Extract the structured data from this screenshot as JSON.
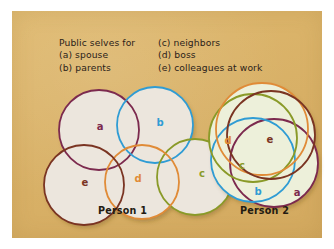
{
  "figure": {
    "background_color": "#ffffff",
    "panel_color": "#d9b267"
  },
  "legend": {
    "left_column": [
      "Public selves for",
      "(a) spouse",
      "(b) parents"
    ],
    "right_column": [
      "(c) neighbors",
      "(d) boss",
      "(e) colleagues at work"
    ]
  },
  "captions": {
    "person_1": "Person 1",
    "person_2": "Person 2"
  },
  "colors": {
    "a": "#7c2a4e",
    "b": "#2f9cd4",
    "c": "#8a9a28",
    "d": "#e08b37",
    "e": "#7a3422",
    "fill_person_1": "#ece6dd",
    "fill_person_2": "#edf0da"
  },
  "chart_data": {
    "type": "venn",
    "set_labels": [
      "a",
      "b",
      "c",
      "d",
      "e"
    ],
    "set_meanings": {
      "a": "spouse",
      "b": "parents",
      "c": "neighbors",
      "d": "boss",
      "e": "colleagues at work"
    },
    "diagrams": [
      {
        "name": "Person 1",
        "description": "Five public selves with little overlap — loosely arranged circles touching only at edges",
        "circles": [
          {
            "label": "a",
            "cx": 57,
            "cy": 45,
            "r": 40,
            "stroke": "#7c2a4e",
            "label_x": 58,
            "label_y": 42
          },
          {
            "label": "b",
            "cx": 113,
            "cy": 40,
            "r": 38,
            "stroke": "#2f9cd4",
            "label_x": 118,
            "label_y": 38
          },
          {
            "label": "c",
            "cx": 153,
            "cy": 92,
            "r": 38,
            "stroke": "#8a9a28",
            "label_x": 160,
            "label_y": 89
          },
          {
            "label": "d",
            "cx": 100,
            "cy": 97,
            "r": 37,
            "stroke": "#e08b37",
            "label_x": 96,
            "label_y": 94
          },
          {
            "label": "e",
            "cx": 42,
            "cy": 100,
            "r": 40,
            "stroke": "#7a3422",
            "label_x": 43,
            "label_y": 98
          }
        ]
      },
      {
        "name": "Person 2",
        "description": "Five public selves with heavy overlap — tightly clustered concentric circles",
        "circles": [
          {
            "label": "a",
            "cx": 76,
            "cy": 78,
            "r": 44,
            "stroke": "#7c2a4e",
            "label_x": 99,
            "label_y": 108
          },
          {
            "label": "b",
            "cx": 55,
            "cy": 75,
            "r": 42,
            "stroke": "#2f9cd4",
            "label_x": 60,
            "label_y": 107
          },
          {
            "label": "c",
            "cx": 55,
            "cy": 53,
            "r": 44,
            "stroke": "#8a9a28",
            "label_x": 44,
            "label_y": 81
          },
          {
            "label": "d",
            "cx": 64,
            "cy": 44,
            "r": 46,
            "stroke": "#e08b37",
            "label_x": 30,
            "label_y": 56
          },
          {
            "label": "e",
            "cx": 73,
            "cy": 50,
            "r": 44,
            "stroke": "#7a3422",
            "label_x": 72,
            "label_y": 55
          }
        ]
      }
    ]
  }
}
